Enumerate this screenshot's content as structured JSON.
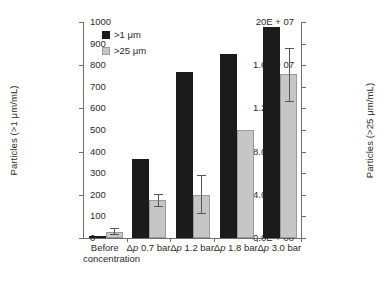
{
  "chart_data": {
    "type": "bar",
    "title": "",
    "xlabel": "",
    "ylabel": "Particles (>1 μm/mL)",
    "ylabel_right": "Particles (>25 μm/mL)",
    "grid": false,
    "legend_position": "top-left",
    "categories": [
      "Before concentration",
      "Δp 0.7 bar",
      "Δp 1.2 bar",
      "Δp 1.8 bar",
      "Δp 3.0 bar"
    ],
    "category_labels": [
      {
        "line1": "Before",
        "line2": "concentration",
        "prefix": "",
        "italic": ""
      },
      {
        "line1": "0.7 bar",
        "line2": "",
        "prefix": "Δ",
        "italic": "p"
      },
      {
        "line1": "1.2 bar",
        "line2": "",
        "prefix": "Δ",
        "italic": "p"
      },
      {
        "line1": "1.8 bar",
        "line2": "",
        "prefix": "Δ",
        "italic": "p"
      },
      {
        "line1": "3.0 bar",
        "line2": "",
        "prefix": "Δ",
        "italic": "p"
      }
    ],
    "series": [
      {
        "name": ">1 μm",
        "axis": "left",
        "color": "#1b1b1b",
        "values": [
          100000,
          7300000,
          15400000,
          17000000,
          19500000
        ],
        "errors": [
          null,
          null,
          null,
          null,
          null
        ]
      },
      {
        "name": ">25 μm",
        "axis": "right",
        "color": "#c6c6c6",
        "values": [
          30,
          178,
          200,
          500,
          760
        ],
        "errors": [
          {
            "low": 18,
            "high": 44
          },
          {
            "low": 150,
            "high": 205
          },
          {
            "low": 115,
            "high": 290
          },
          null,
          {
            "low": 635,
            "high": 880
          }
        ]
      }
    ],
    "yaxis_left": {
      "min": 0,
      "max": 20000000,
      "tick_values": [
        0,
        4000000,
        8000000,
        12000000,
        16000000,
        20000000
      ],
      "tick_labels": [
        "0.0E + 00",
        "4.0E + 06",
        "8.0E + 06",
        "1.2E + 07",
        "1.6E + 07",
        "20E + 07"
      ]
    },
    "yaxis_right": {
      "min": 0,
      "max": 1000,
      "tick_values": [
        0,
        100,
        200,
        300,
        400,
        500,
        600,
        700,
        800,
        900,
        1000
      ],
      "tick_labels": [
        "0",
        "100",
        "200",
        "300",
        "400",
        "500",
        "600",
        "700",
        "800",
        "900",
        "1000"
      ]
    },
    "legend": [
      {
        "label": ">1 μm",
        "swatch": "black"
      },
      {
        "label": ">25 μm",
        "swatch": "gray"
      }
    ]
  }
}
